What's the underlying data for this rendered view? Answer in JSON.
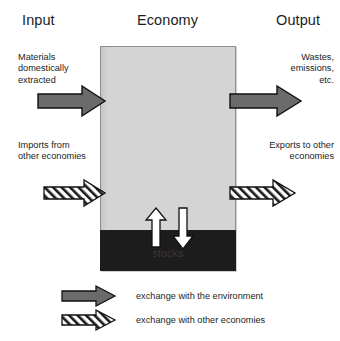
{
  "columns": {
    "input": "Input",
    "economy": "Economy",
    "output": "Output"
  },
  "annotations": {
    "materials": "Materials\ndomestically\nextracted",
    "wastes": "Wastes,\nemissions,\netc.",
    "imports": "Imports from\nother economies",
    "exports": "Exports to other\neconomies"
  },
  "box": {
    "stocks_label": "stocks"
  },
  "legend": [
    {
      "label": "exchange with the environment",
      "style": "solid"
    },
    {
      "label": "exchange with other economies",
      "style": "hatched"
    }
  ],
  "colors": {
    "economy_fill": "#d4d4d4",
    "stocks_fill": "#1c1c1c",
    "solid_arrow_fill": "#6b6b6b",
    "hatched_arrow_fill": "#ffffff",
    "outline": "#111111",
    "text": "#1d1d1d"
  }
}
